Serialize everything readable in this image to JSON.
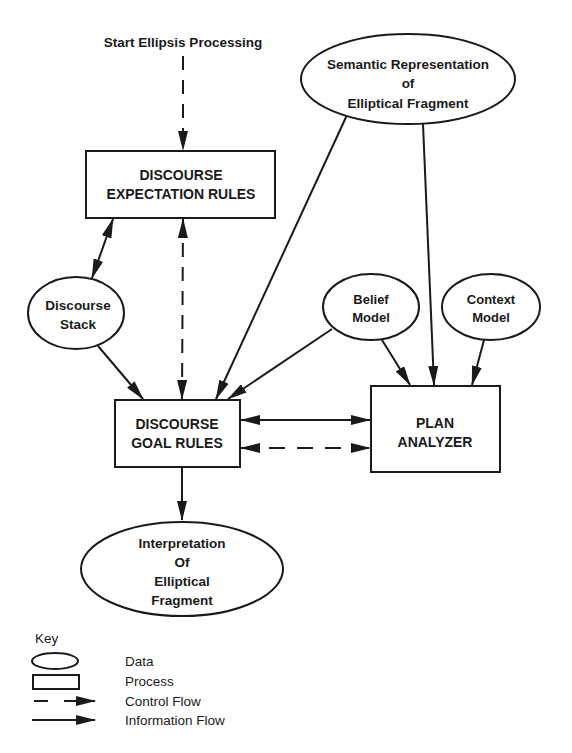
{
  "start": {
    "label": "Start Ellipsis Processing"
  },
  "nodes": {
    "expectation_rules": {
      "type": "process",
      "lines": [
        "DISCOURSE",
        "EXPECTATION RULES"
      ]
    },
    "semantic_rep": {
      "type": "data",
      "lines": [
        "Semantic Representation",
        "of",
        "Elliptical Fragment"
      ]
    },
    "discourse_stack": {
      "type": "data",
      "lines": [
        "Discourse",
        "Stack"
      ]
    },
    "belief_model": {
      "type": "data",
      "lines": [
        "Belief",
        "Model"
      ]
    },
    "context_model": {
      "type": "data",
      "lines": [
        "Context",
        "Model"
      ]
    },
    "goal_rules": {
      "type": "process",
      "lines": [
        "DISCOURSE",
        "GOAL RULES"
      ]
    },
    "plan_analyzer": {
      "type": "process",
      "lines": [
        "PLAN",
        "ANALYZER"
      ]
    },
    "interpretation": {
      "type": "data",
      "lines": [
        "Interpretation",
        "Of",
        "Elliptical",
        "Fragment"
      ]
    }
  },
  "edges": [
    {
      "from": "start",
      "to": "expectation_rules",
      "kind": "control"
    },
    {
      "from": "expectation_rules",
      "to": "discourse_stack",
      "kind": "information",
      "bidirectional": true
    },
    {
      "from": "expectation_rules",
      "to": "goal_rules",
      "kind": "control",
      "bidirectional": true
    },
    {
      "from": "discourse_stack",
      "to": "goal_rules",
      "kind": "information"
    },
    {
      "from": "semantic_rep",
      "to": "goal_rules",
      "kind": "information"
    },
    {
      "from": "semantic_rep",
      "to": "plan_analyzer",
      "kind": "information"
    },
    {
      "from": "belief_model",
      "to": "goal_rules",
      "kind": "information"
    },
    {
      "from": "belief_model",
      "to": "plan_analyzer",
      "kind": "information"
    },
    {
      "from": "context_model",
      "to": "plan_analyzer",
      "kind": "information"
    },
    {
      "from": "goal_rules",
      "to": "plan_analyzer",
      "kind": "information",
      "bidirectional": true
    },
    {
      "from": "goal_rules",
      "to": "plan_analyzer",
      "kind": "control",
      "bidirectional": true
    },
    {
      "from": "goal_rules",
      "to": "interpretation",
      "kind": "information"
    }
  ],
  "key": {
    "title": "Key",
    "items": [
      {
        "symbol": "ellipse",
        "label": "Data"
      },
      {
        "symbol": "rectangle",
        "label": "Process"
      },
      {
        "symbol": "dashed-arrow",
        "label": "Control Flow"
      },
      {
        "symbol": "solid-arrow",
        "label": "Information Flow"
      }
    ]
  }
}
